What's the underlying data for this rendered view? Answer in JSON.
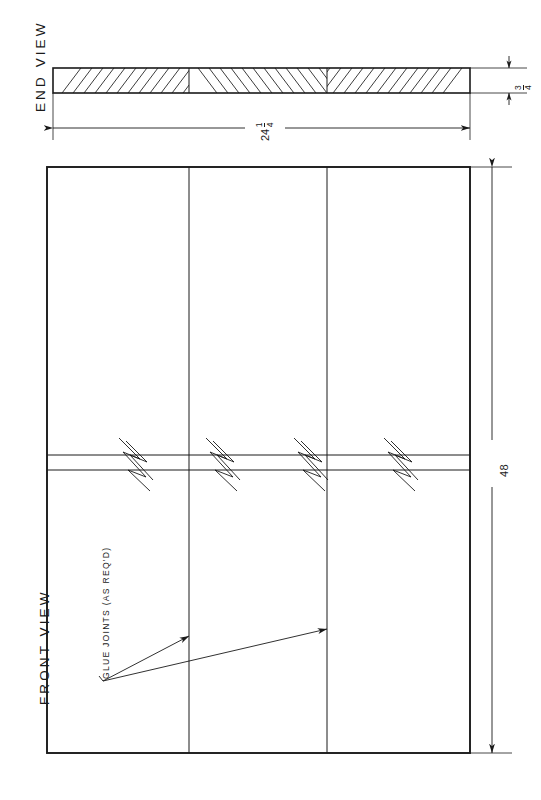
{
  "drawing": {
    "title_end_view": "END VIEW",
    "title_front_view": "FRONT VIEW",
    "callout": "GLUE JOINTS (AS REQ'D)",
    "line_color": "#1a1a1a",
    "background": "#ffffff"
  },
  "dimensions": {
    "width": {
      "whole": "24",
      "numerator": "1",
      "denominator": "4",
      "full": "24 1/4"
    },
    "thickness": {
      "whole": "",
      "numerator": "3",
      "denominator": "4",
      "full": "3/4"
    },
    "length": {
      "whole": "48",
      "numerator": "",
      "denominator": "",
      "full": "48"
    }
  },
  "end_view": {
    "board_left": 53,
    "board_right": 470,
    "board_top": 68,
    "board_bottom": 93,
    "joint_positions": [
      189,
      327
    ],
    "hatch_spacing": 11
  },
  "front_view": {
    "left": 47,
    "right": 470,
    "top": 167,
    "bottom": 753,
    "joint_positions": [
      189,
      327
    ],
    "break_top": 455,
    "break_bottom": 470,
    "break_symbol_positions": [
      135,
      222,
      310,
      400
    ]
  },
  "leaders": {
    "origin_x": 103,
    "origin_y": 681,
    "targets": [
      {
        "x": 189,
        "y": 636
      },
      {
        "x": 327,
        "y": 629
      }
    ]
  }
}
